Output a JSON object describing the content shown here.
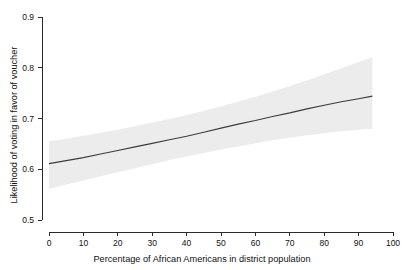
{
  "chart_data": {
    "type": "line",
    "title": "",
    "subtitle": "",
    "xlabel": "Percentage of African Americans in district population",
    "ylabel": "Likelihood of voting in favor of voucher",
    "xlim": [
      0,
      100
    ],
    "ylim": [
      0.5,
      0.9
    ],
    "xticks": [
      0,
      10,
      20,
      30,
      40,
      50,
      60,
      70,
      80,
      90,
      100
    ],
    "xtick_labels": [
      "0",
      "10",
      "20",
      "30",
      "40",
      "50",
      "60",
      "70",
      "80",
      "90",
      "100"
    ],
    "yticks": [
      0.5,
      0.6,
      0.7,
      0.8,
      0.9
    ],
    "ytick_labels": [
      "0.5",
      "0.6",
      "0.7",
      "0.8",
      "0.9"
    ],
    "grid": false,
    "legend": false,
    "legend_position": "none",
    "x_data_range": [
      0,
      94
    ],
    "line_color": "#3c3c3c",
    "band_color": "#ececec",
    "series": [
      {
        "name": "Predicted likelihood",
        "x": [
          0,
          5,
          10,
          15,
          20,
          25,
          30,
          35,
          40,
          45,
          50,
          55,
          60,
          65,
          70,
          75,
          80,
          85,
          90,
          94
        ],
        "values": [
          0.611,
          0.617,
          0.623,
          0.63,
          0.637,
          0.644,
          0.651,
          0.658,
          0.665,
          0.673,
          0.681,
          0.689,
          0.696,
          0.704,
          0.711,
          0.719,
          0.726,
          0.733,
          0.739,
          0.744
        ]
      },
      {
        "name": "Upper 95% confidence bound",
        "x": [
          0,
          5,
          10,
          15,
          20,
          25,
          30,
          35,
          40,
          45,
          50,
          55,
          60,
          65,
          70,
          75,
          80,
          85,
          90,
          94
        ],
        "values": [
          0.655,
          0.66,
          0.666,
          0.672,
          0.678,
          0.685,
          0.692,
          0.699,
          0.707,
          0.715,
          0.724,
          0.733,
          0.743,
          0.753,
          0.764,
          0.775,
          0.787,
          0.799,
          0.811,
          0.821
        ]
      },
      {
        "name": "Lower 95% confidence bound",
        "x": [
          0,
          5,
          10,
          15,
          20,
          25,
          30,
          35,
          40,
          45,
          50,
          55,
          60,
          65,
          70,
          75,
          80,
          85,
          90,
          94
        ],
        "values": [
          0.561,
          0.57,
          0.578,
          0.586,
          0.594,
          0.602,
          0.61,
          0.618,
          0.625,
          0.632,
          0.639,
          0.645,
          0.651,
          0.657,
          0.662,
          0.667,
          0.671,
          0.675,
          0.678,
          0.68
        ]
      }
    ]
  }
}
